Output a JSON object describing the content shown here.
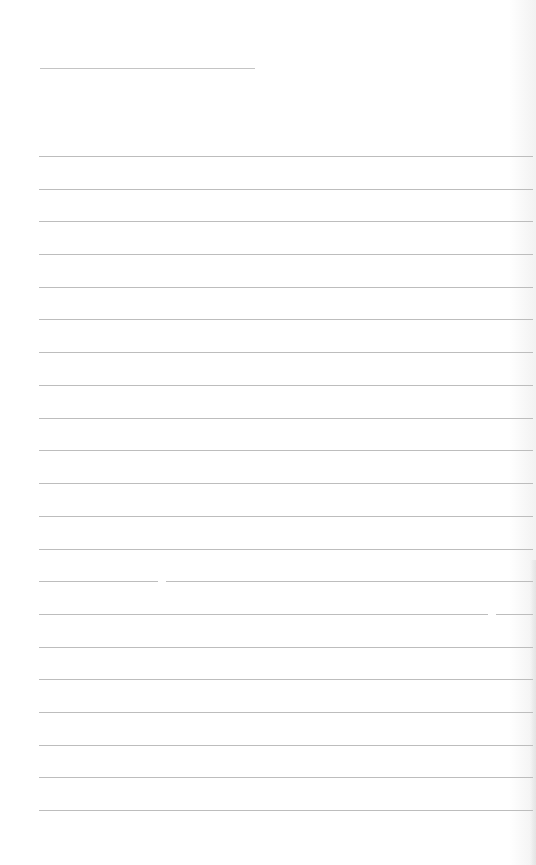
{
  "page": {
    "type": "lined-notebook-page",
    "background": "#ffffff",
    "line_color": "#bdbdbd",
    "header_line": {
      "x": 40,
      "y": 68,
      "width": 215
    },
    "ruled_lines": {
      "x": 39,
      "width": 494,
      "y_positions": [
        156,
        189,
        221,
        254,
        287,
        319,
        352,
        385,
        418,
        450,
        483,
        516,
        549,
        581,
        614,
        647,
        679,
        712,
        745,
        777,
        810
      ]
    },
    "line_gaps": [
      {
        "x": 158,
        "y": 580,
        "width": 8
      },
      {
        "x": 488,
        "y": 613,
        "width": 8
      }
    ],
    "text_content": ""
  }
}
